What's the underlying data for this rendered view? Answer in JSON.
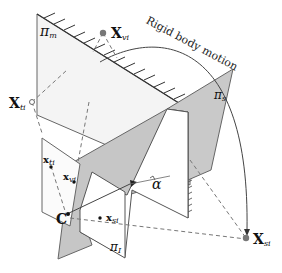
{
  "figure": {
    "caption_text": "Rigid body motion",
    "planes": {
      "mirror": {
        "symbol": "π",
        "subscript": "m"
      },
      "stereo": {
        "symbol": "π",
        "subscript": "s"
      },
      "image": {
        "symbol": "π",
        "subscript": "I"
      }
    },
    "points": {
      "x_vi": {
        "base": "X",
        "subscript": "vi"
      },
      "x_ti": {
        "base": "X",
        "subscript": "ti"
      },
      "x_si": {
        "base": "X",
        "subscript": "si"
      },
      "small_x_ti": {
        "base": "x",
        "subscript": "ti"
      },
      "small_x_vi": {
        "base": "x",
        "subscript": "vi"
      },
      "small_x_si": {
        "base": "x",
        "subscript": "si"
      },
      "camera_center": {
        "label": "C"
      }
    },
    "angle": {
      "label": "α"
    },
    "colors": {
      "plane_light": "#f2f2f2",
      "plane_gray": "#c8c8c8",
      "stroke": "#555555",
      "dashed": "#777777",
      "point_fill": "#777777"
    }
  }
}
